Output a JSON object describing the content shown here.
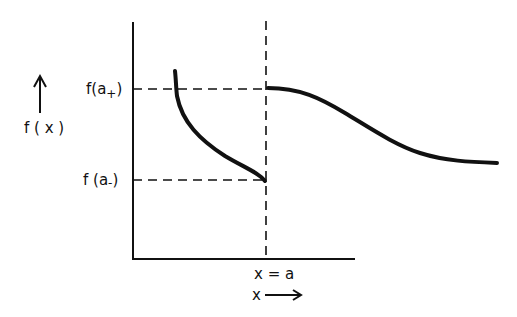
{
  "diagram": {
    "type": "function discontinuity (jump) sketch",
    "y_axis_label": "f ( x )",
    "x_axis_label": "x",
    "tick_labels": {
      "upper": "f(a",
      "upper_sub": "+",
      "upper_close": ")",
      "lower": "f (a",
      "lower_sub": "-",
      "lower_close": ")",
      "x_point": "x = a"
    },
    "colors": {
      "ink": "#111111",
      "background": "#ffffff"
    },
    "curves": {
      "left_branch": "decreasing curve approaching f(a-) at x=a from the left",
      "right_branch": "curve starting at f(a+) at x=a, decreasing toward an asymptote"
    }
  }
}
